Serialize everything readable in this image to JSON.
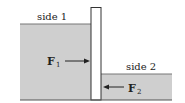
{
  "diagram": {
    "labels": {
      "side1": "side 1",
      "side2": "side 2"
    },
    "forces": [
      {
        "symbol": "F",
        "subscript": "1",
        "direction": "right"
      },
      {
        "symbol": "F",
        "subscript": "2",
        "direction": "left"
      }
    ],
    "colors": {
      "fluid": "#cfcfcf",
      "wall": "#ffffff",
      "stroke": "#333333"
    }
  }
}
